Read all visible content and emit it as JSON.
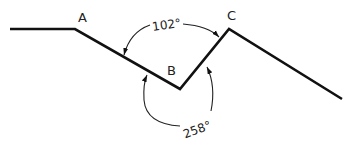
{
  "diagram": {
    "points": {
      "A": {
        "label": "A"
      },
      "B": {
        "label": "B"
      },
      "C": {
        "label": "C"
      }
    },
    "angles": {
      "interior": {
        "label": "102°"
      },
      "exterior": {
        "label": "258°"
      }
    },
    "colors": {
      "line": "#111111",
      "text": "#222222"
    }
  }
}
